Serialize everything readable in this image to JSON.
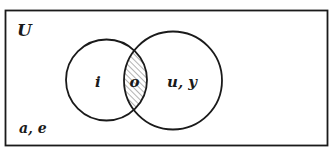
{
  "diagram": {
    "type": "venn",
    "universe": {
      "label": "U",
      "elements_outside": "a, e",
      "rect": {
        "x": 5.5,
        "y": 10.5,
        "width": 322,
        "height": 135
      }
    },
    "sets": [
      {
        "id": "left",
        "only_elements": "i",
        "cx": 106.5,
        "cy": 80,
        "r": 40.5
      },
      {
        "id": "right",
        "only_elements": "u, y",
        "cx": 173,
        "cy": 80.5,
        "r": 49
      }
    ],
    "intersection": {
      "elements": "o",
      "shaded": true,
      "pattern": "diagonal-hatch"
    },
    "colors": {
      "stroke": "#1a1a1a",
      "hatch": "#8a8a8a",
      "background": "#ffffff"
    }
  }
}
